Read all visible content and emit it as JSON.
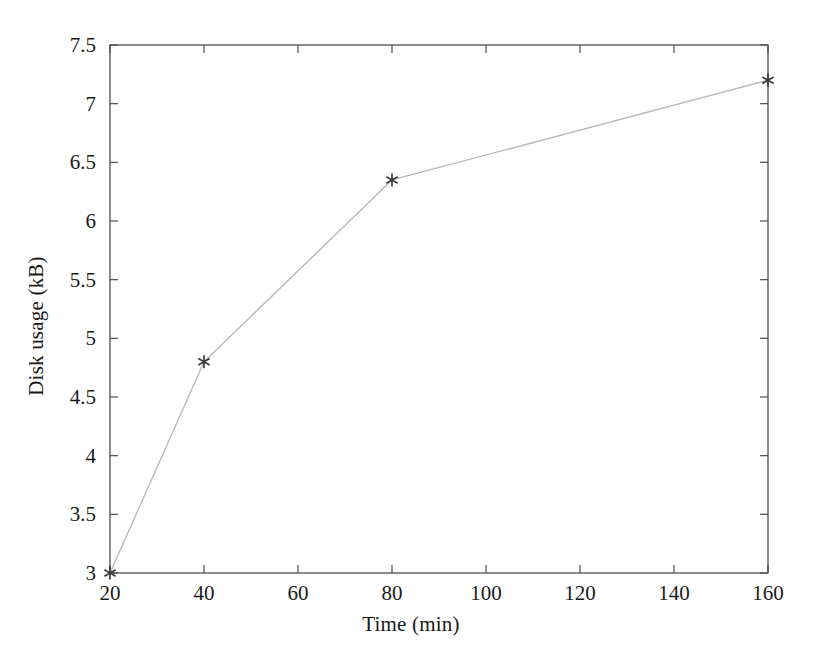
{
  "chart_data": {
    "type": "line",
    "title": "",
    "subtitle": "",
    "xlabel": "Time (min)",
    "ylabel": "Disk usage (kB)",
    "x": [
      20,
      40,
      80,
      160
    ],
    "values": [
      3.0,
      4.8,
      6.35,
      7.2
    ],
    "series": [
      {
        "name": "Disk usage",
        "points": [
          {
            "x": 20,
            "y": 3.0
          },
          {
            "x": 40,
            "y": 4.8
          },
          {
            "x": 80,
            "y": 6.35
          },
          {
            "x": 160,
            "y": 7.2
          }
        ]
      }
    ],
    "xlim": [
      20,
      160
    ],
    "ylim": [
      3,
      7.5
    ],
    "xticks": [
      20,
      40,
      60,
      80,
      100,
      120,
      140,
      160
    ],
    "xtick_labels": [
      "20",
      "40",
      "60",
      "80",
      "100",
      "120",
      "140",
      "160"
    ],
    "yticks": [
      3,
      3.5,
      4,
      4.5,
      5,
      5.5,
      6,
      6.5,
      7,
      7.5
    ],
    "ytick_labels": [
      "3",
      "3.5",
      "4",
      "4.5",
      "5",
      "5.5",
      "6",
      "6.5",
      "7",
      "7.5"
    ],
    "grid": false,
    "legend": null,
    "legend_position": "none",
    "annotations": [],
    "marker": "star",
    "line_color": "#b9b9b9",
    "marker_color": "#3a3a3a",
    "axis_color": "#4d4d4d",
    "background_color": "#ffffff",
    "frame": "box"
  }
}
